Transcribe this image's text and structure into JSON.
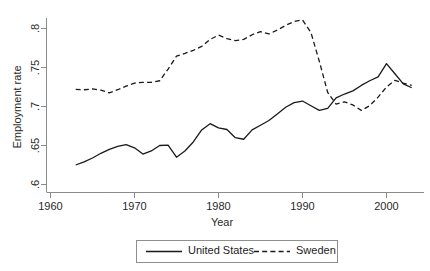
{
  "chart_data": {
    "type": "line",
    "title": "",
    "xlabel": "Year",
    "ylabel": "Employment rate",
    "xlim": [
      1960,
      2004
    ],
    "ylim": [
      0.585,
      0.815
    ],
    "grid": false,
    "legend_position": "bottom",
    "xticks": [
      1960,
      1970,
      1980,
      1990,
      2000
    ],
    "xtick_labels": [
      "1960",
      "1970",
      "1980",
      "1990",
      "2000"
    ],
    "yticks": [
      0.6,
      0.65,
      0.7,
      0.75,
      0.8
    ],
    "ytick_labels": [
      ".6",
      ".65",
      ".7",
      ".75",
      ".8"
    ],
    "x": [
      1963,
      1964,
      1965,
      1966,
      1967,
      1968,
      1969,
      1970,
      1971,
      1972,
      1973,
      1974,
      1975,
      1976,
      1977,
      1978,
      1979,
      1980,
      1981,
      1982,
      1983,
      1984,
      1985,
      1986,
      1987,
      1988,
      1989,
      1990,
      1991,
      1992,
      1993,
      1994,
      1995,
      1996,
      1997,
      1998,
      1999,
      2000,
      2001,
      2002,
      2003
    ],
    "series": [
      {
        "name": "United States",
        "style": "solid",
        "color": "#1a1a1a",
        "values": [
          0.625,
          0.629,
          0.634,
          0.64,
          0.645,
          0.649,
          0.6512,
          0.647,
          0.639,
          0.643,
          0.65,
          0.6505,
          0.635,
          0.643,
          0.6545,
          0.67,
          0.678,
          0.6725,
          0.6705,
          0.66,
          0.658,
          0.67,
          0.676,
          0.682,
          0.6905,
          0.699,
          0.705,
          0.707,
          0.701,
          0.695,
          0.6975,
          0.711,
          0.716,
          0.72,
          0.727,
          0.733,
          0.738,
          0.755,
          0.742,
          0.729,
          0.724
        ]
      },
      {
        "name": "Sweden",
        "style": "dashed",
        "color": "#1a1a1a",
        "values": [
          0.722,
          0.7215,
          0.7225,
          0.721,
          0.7175,
          0.7215,
          0.726,
          0.73,
          0.731,
          0.731,
          0.733,
          0.748,
          0.7645,
          0.768,
          0.772,
          0.777,
          0.786,
          0.7915,
          0.787,
          0.7845,
          0.786,
          0.792,
          0.796,
          0.793,
          0.798,
          0.804,
          0.809,
          0.811,
          0.795,
          0.758,
          0.718,
          0.703,
          0.706,
          0.702,
          0.695,
          0.701,
          0.712,
          0.725,
          0.7335,
          0.73,
          0.727
        ]
      }
    ],
    "legend_entries": [
      "United States",
      "Sweden"
    ]
  },
  "axes": {
    "y_title": "Employment rate",
    "x_title": "Year"
  },
  "legend": {
    "items": [
      {
        "label": "United States",
        "style": "solid"
      },
      {
        "label": "Sweden",
        "style": "dashed"
      }
    ]
  }
}
